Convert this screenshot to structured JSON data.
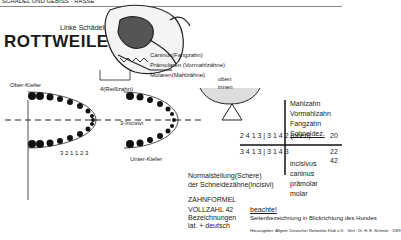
{
  "header": {
    "top_cut_text": "SCHÄDEL UND GEBISS · RASSE",
    "breed_title": "ROTTWEILER",
    "skull_side_label": "Linke Schädelseite"
  },
  "tooth_labels": {
    "reisszahn": "4(Reißzahn)",
    "canine_item": "C",
    "canine_desc": "Caninus(Fangzahn)",
    "premolar_desc": "Prämolaren (Vormahlzähne)",
    "molar_desc": "Molaren(Mahlzähne)",
    "incisivi_upper": "3-Incisivi",
    "incisivi_nums": "3 2 1 1 2 3",
    "upper_jaw": "Ober-Kiefer",
    "lower_jaw": "Unter-Kiefer",
    "left_nums": [
      "2",
      "1",
      "(R) 4",
      "3",
      "2",
      "1",
      "(F) C"
    ],
    "right_nums": [
      "2",
      "1",
      "3",
      "2",
      "1",
      "C"
    ],
    "lower_left_nums": [
      "(F) C",
      "1",
      "2",
      "3",
      "4",
      "1",
      "2",
      "3"
    ],
    "lower_right_nums": [
      "C",
      "1",
      "2",
      "3",
      "4",
      "1",
      "2",
      "3"
    ]
  },
  "normal_position": {
    "line1": "Normalstellung(Schere)",
    "line2": "der Schneidezähne(incisivi)",
    "oben": "oben",
    "innen": "innen"
  },
  "formula": {
    "upper_row": "2 4 1 3 | 3 1 4 2 (oben)",
    "upper_total": "20",
    "lower_row": "3 4 1 3 | 3 1 4 3",
    "lower_total": "22",
    "grand_total": "42",
    "zahnformel_label": "ZAHNFORMEL",
    "vollzahl_label": "VOLLZAHL 42",
    "bezeichnungen_label": "Bezeichnungen",
    "lat_deutsch_label": "lat. + deutsch",
    "german_terms": [
      "Mahlzahn",
      "Vormahlzahn",
      "Fangzahn",
      "Schneidez."
    ],
    "latin_terms": [
      "incisivus",
      "caninus",
      "prämolar",
      "molar"
    ],
    "col_nums_de": [
      "3",
      "4",
      "1",
      "3"
    ],
    "col_nums_lat": [
      "3",
      "1",
      "4",
      "3"
    ]
  },
  "notes": {
    "beachte": "beachte!",
    "seitenbezeichnung": "Seitenbezeichnung in Blickrichtung des Hundes",
    "footer": "Herausgeber: Allgem. Deutscher Rottweiler-Klub e.V. · Verf.: Dr. H. E. Schmitz · 1969"
  }
}
